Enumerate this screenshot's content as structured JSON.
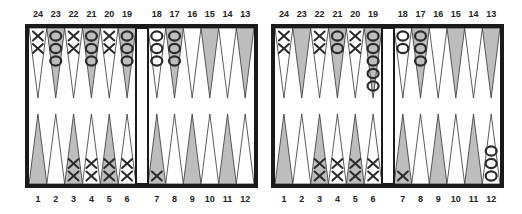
{
  "colors": {
    "frame": "#1a1a1a",
    "shaded_point": "#bdbdbd",
    "light_point": "#ffffff",
    "checker_stroke": "#2a2a2a",
    "label": "#222222"
  },
  "top_labels": [
    "24",
    "23",
    "22",
    "21",
    "20",
    "19",
    "18",
    "17",
    "16",
    "15",
    "14",
    "13"
  ],
  "bottom_labels": [
    "1",
    "2",
    "3",
    "4",
    "5",
    "6",
    "7",
    "8",
    "9",
    "10",
    "11",
    "12"
  ],
  "boards": [
    {
      "name": "left-position",
      "top_points": [
        {
          "point": 24,
          "piece": "X",
          "count": 2
        },
        {
          "point": 23,
          "piece": "O",
          "count": 3
        },
        {
          "point": 22,
          "piece": "X",
          "count": 2
        },
        {
          "point": 21,
          "piece": "O",
          "count": 3
        },
        {
          "point": 20,
          "piece": "X",
          "count": 2
        },
        {
          "point": 19,
          "piece": "O",
          "count": 3
        },
        {
          "point": 18,
          "piece": "O",
          "count": 3
        },
        {
          "point": 17,
          "piece": "O",
          "count": 3
        },
        {
          "point": 16,
          "piece": "",
          "count": 0
        },
        {
          "point": 15,
          "piece": "",
          "count": 0
        },
        {
          "point": 14,
          "piece": "",
          "count": 0
        },
        {
          "point": 13,
          "piece": "",
          "count": 0
        }
      ],
      "bottom_points": [
        {
          "point": 1,
          "piece": "",
          "count": 0
        },
        {
          "point": 2,
          "piece": "",
          "count": 0
        },
        {
          "point": 3,
          "piece": "X",
          "count": 2
        },
        {
          "point": 4,
          "piece": "X",
          "count": 2
        },
        {
          "point": 5,
          "piece": "X",
          "count": 2
        },
        {
          "point": 6,
          "piece": "X",
          "count": 2
        },
        {
          "point": 7,
          "piece": "X",
          "count": 1
        },
        {
          "point": 8,
          "piece": "",
          "count": 0
        },
        {
          "point": 9,
          "piece": "",
          "count": 0
        },
        {
          "point": 10,
          "piece": "",
          "count": 0
        },
        {
          "point": 11,
          "piece": "",
          "count": 0
        },
        {
          "point": 12,
          "piece": "",
          "count": 0
        }
      ]
    },
    {
      "name": "right-position",
      "top_points": [
        {
          "point": 24,
          "piece": "X",
          "count": 2
        },
        {
          "point": 23,
          "piece": "",
          "count": 0
        },
        {
          "point": 22,
          "piece": "X",
          "count": 2
        },
        {
          "point": 21,
          "piece": "O",
          "count": 2
        },
        {
          "point": 20,
          "piece": "X",
          "count": 2
        },
        {
          "point": 19,
          "piece": "O",
          "count": 5
        },
        {
          "point": 18,
          "piece": "O",
          "count": 2
        },
        {
          "point": 17,
          "piece": "O",
          "count": 3
        },
        {
          "point": 16,
          "piece": "",
          "count": 0
        },
        {
          "point": 15,
          "piece": "",
          "count": 0
        },
        {
          "point": 14,
          "piece": "",
          "count": 0
        },
        {
          "point": 13,
          "piece": "",
          "count": 0
        }
      ],
      "bottom_points": [
        {
          "point": 1,
          "piece": "",
          "count": 0
        },
        {
          "point": 2,
          "piece": "",
          "count": 0
        },
        {
          "point": 3,
          "piece": "X",
          "count": 2
        },
        {
          "point": 4,
          "piece": "X",
          "count": 2
        },
        {
          "point": 5,
          "piece": "X",
          "count": 2
        },
        {
          "point": 6,
          "piece": "X",
          "count": 2
        },
        {
          "point": 7,
          "piece": "X",
          "count": 1
        },
        {
          "point": 8,
          "piece": "",
          "count": 0
        },
        {
          "point": 9,
          "piece": "",
          "count": 0
        },
        {
          "point": 10,
          "piece": "",
          "count": 0
        },
        {
          "point": 11,
          "piece": "",
          "count": 0
        },
        {
          "point": 12,
          "piece": "O",
          "count": 3
        }
      ]
    }
  ]
}
